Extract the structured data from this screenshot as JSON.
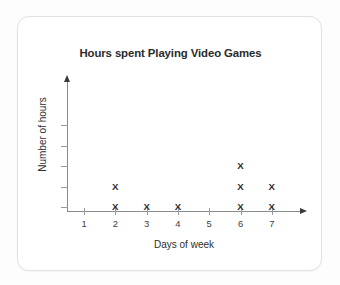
{
  "card": {
    "background_color": "#ffffff",
    "border_color": "#e2e2e2"
  },
  "chart_data": {
    "type": "scatter",
    "plot_style": "dot-plot-x-marks",
    "title": "Hours spent Playing Video Games",
    "xlabel": "Days of week",
    "ylabel": "Number of hours",
    "categories": [
      "1",
      "2",
      "3",
      "4",
      "5",
      "6",
      "7"
    ],
    "x": [
      1,
      2,
      3,
      4,
      5,
      6,
      7
    ],
    "values": [
      0,
      2,
      1,
      1,
      0,
      3,
      2
    ],
    "marker": "X",
    "marker_color": "#2a2a2a",
    "xlim": [
      0.5,
      7.5
    ],
    "ylim": [
      0,
      5
    ],
    "y_tick_count": 5,
    "y_tick_labels": [
      "",
      "",
      "",
      "",
      ""
    ],
    "x_tick_labels": [
      "1",
      "2",
      "3",
      "4",
      "5",
      "6",
      "7"
    ],
    "grid": false,
    "legend": false,
    "axis_color": "#8b8b8b",
    "axis_arrow_x": true,
    "axis_arrow_y": true
  }
}
